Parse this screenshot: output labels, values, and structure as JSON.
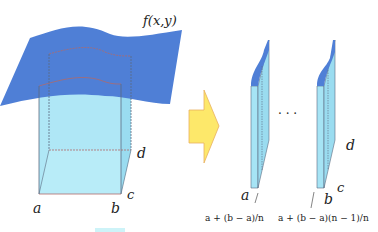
{
  "diagram": {
    "left": {
      "function_label": "f(x,y)",
      "corner_labels": {
        "a": "a",
        "b": "b",
        "c": "c",
        "d": "d"
      }
    },
    "arrow": {
      "color": "#fde86a",
      "border": "#e8b060"
    },
    "right": {
      "slice_first_label": "a",
      "slice_last_label": "b",
      "corner_c": "c",
      "corner_d": "d",
      "ellipsis": ". . .",
      "annotation_first": "a + (b − a)/n",
      "annotation_last": "a + (b − a)(n − 1)/n"
    },
    "colors": {
      "surface": "#4f7fd6",
      "solid": "#a6e4f5",
      "edge": "#5a6a80",
      "dashed_top": "#b06a6a"
    }
  }
}
